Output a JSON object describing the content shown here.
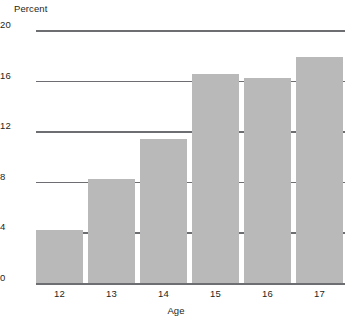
{
  "chart_data": {
    "type": "bar",
    "title": "",
    "subtitle": "",
    "xlabel": "Age",
    "ylabel": "Percent",
    "categories": [
      "12",
      "13",
      "14",
      "15",
      "16",
      "17"
    ],
    "values": [
      4.2,
      8.2,
      11.4,
      16.5,
      16.2,
      17.9
    ],
    "series": [
      {
        "name": "Percent",
        "values": [
          4.2,
          8.2,
          11.4,
          16.5,
          16.2,
          17.9
        ]
      }
    ],
    "ylim": [
      0,
      20
    ],
    "yticks": [
      0,
      4,
      8,
      12,
      16,
      20
    ],
    "ytick_labels": [
      "0",
      "4",
      "8",
      "12",
      "16",
      "20"
    ],
    "xtick_labels": [
      "12",
      "13",
      "14",
      "15",
      "16",
      "17"
    ],
    "grid": true,
    "grid_axis": "y",
    "legend": false,
    "legend_position": "none",
    "annotations": [],
    "colors": {
      "bar_fill": "#b9b9b9",
      "gridline": "#6d6e71",
      "axis_line": "#6d6e71",
      "text": "#231f20",
      "background": "#ffffff"
    }
  }
}
